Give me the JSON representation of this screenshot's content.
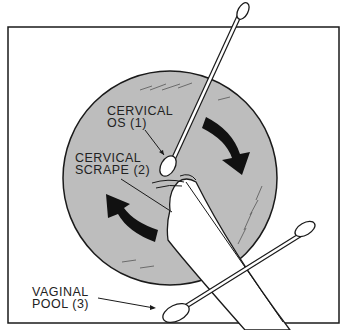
{
  "diagram": {
    "labels": {
      "os_line1": "CERVICAL",
      "os_line2": "OS (1)",
      "scrape_line1": "CERVICAL",
      "scrape_line2": "SCRAPE (2)",
      "pool_line1": "VAGINAL",
      "pool_line2": "POOL (3)"
    },
    "colors": {
      "cervix_fill": "#bdbdbd",
      "ink": "#1a1a1a",
      "background": "#ffffff"
    },
    "icons": [
      "swab-cervical-os",
      "spatula-cervical-scrape",
      "swab-vaginal-pool",
      "rotation-arrow-clockwise",
      "rotation-arrow-counterclockwise"
    ]
  }
}
